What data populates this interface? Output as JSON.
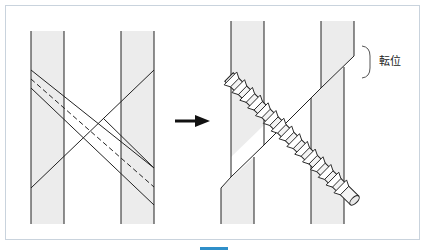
{
  "figure": {
    "label": "転位",
    "colors": {
      "bone": "#ececec",
      "line": "#222222",
      "frame": "#c9d3dd",
      "tab": "#2f8fc9"
    },
    "panels": [
      {
        "name": "before",
        "description": "Two parallel bone segments with planned screw path (dashed) crossing fracture line"
      },
      {
        "name": "after",
        "description": "Screw inserted diagonally, bone segments displaced"
      }
    ],
    "arrow": "right-arrow"
  }
}
